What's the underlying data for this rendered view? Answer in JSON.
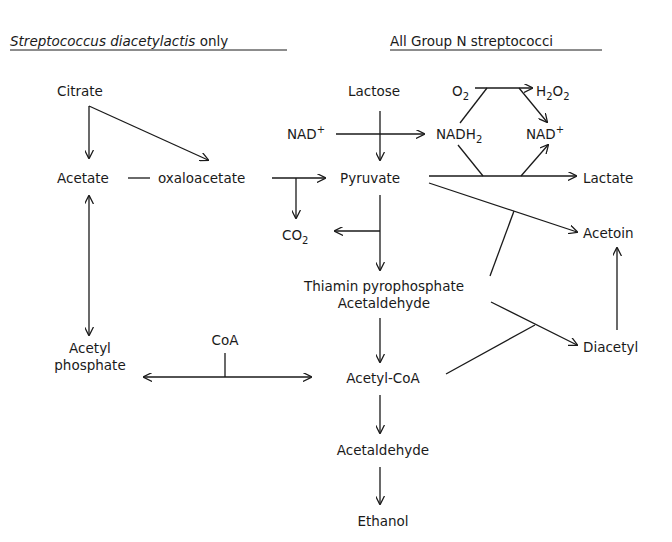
{
  "headers": {
    "left_italic": "Streptococcus diacetylactis",
    "left_suffix": " only",
    "right": "All Group N streptococci"
  },
  "nodes": {
    "citrate": "Citrate",
    "acetate": "Acetate",
    "oxaloacetate": "oxaloacetate",
    "lactose": "Lactose",
    "nad_left": "NAD",
    "nad_left_sup": "+",
    "nadh2": "NADH",
    "nadh2_sub": "2",
    "o2": "O",
    "o2_sub": "2",
    "h2o2_h": "H",
    "h2o2_sub1": "2",
    "h2o2_o": "O",
    "h2o2_sub2": "2",
    "nad_right": "NAD",
    "nad_right_sup": "+",
    "pyruvate": "Pyruvate",
    "lactate": "Lactate",
    "co2": "CO",
    "co2_sub": "2",
    "acetoin": "Acetoin",
    "tpp_line1": "Thiamin pyrophosphate",
    "tpp_line2": "Acetaldehyde",
    "diacetyl": "Diacetyl",
    "acetyl_line1": "Acetyl",
    "acetyl_line2": "phosphate",
    "coa": "CoA",
    "acetyl_coa": "Acetyl-CoA",
    "acetaldehyde": "Acetaldehyde",
    "ethanol": "Ethanol"
  },
  "edges": [
    {
      "from": "Citrate",
      "to": "Acetate"
    },
    {
      "from": "Citrate",
      "to": "oxaloacetate"
    },
    {
      "from": "Acetate",
      "to": "Acetyl phosphate",
      "bidirectional": true
    },
    {
      "from": "oxaloacetate",
      "to": "Pyruvate"
    },
    {
      "from": "oxaloacetate",
      "to": "CO2"
    },
    {
      "from": "Lactose",
      "to": "Pyruvate"
    },
    {
      "from": "NAD+",
      "to": "NADH2"
    },
    {
      "from": "NADH2",
      "to": "O2"
    },
    {
      "from": "O2",
      "to": "H2O2"
    },
    {
      "from": "H2O2",
      "to": "NAD+"
    },
    {
      "from": "Pyruvate",
      "to": "Lactate"
    },
    {
      "from": "NADH2",
      "to": "NAD+",
      "via": "Pyruvate->Lactate"
    },
    {
      "from": "Pyruvate",
      "to": "Acetoin"
    },
    {
      "from": "Thiamin pyrophosphate Acetaldehyde",
      "to": "Acetoin",
      "joins": true
    },
    {
      "from": "Pyruvate",
      "to": "CO2"
    },
    {
      "from": "Pyruvate",
      "to": "Thiamin pyrophosphate Acetaldehyde"
    },
    {
      "from": "Thiamin pyrophosphate Acetaldehyde",
      "to": "Diacetyl"
    },
    {
      "from": "Acetyl-CoA",
      "to": "Diacetyl",
      "joins": true
    },
    {
      "from": "Diacetyl",
      "to": "Acetoin"
    },
    {
      "from": "Thiamin pyrophosphate Acetaldehyde",
      "to": "Acetyl-CoA"
    },
    {
      "from": "Acetyl-CoA",
      "to": "Acetyl phosphate",
      "bidirectional": true,
      "cofactor": "CoA"
    },
    {
      "from": "Acetyl-CoA",
      "to": "Acetaldehyde"
    },
    {
      "from": "Acetaldehyde",
      "to": "Ethanol"
    }
  ]
}
